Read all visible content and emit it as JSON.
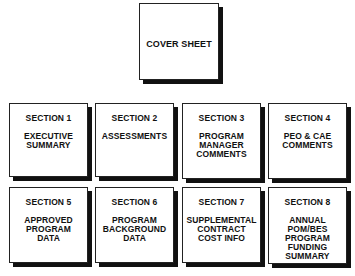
{
  "cover": {
    "title": "COVER SHEET"
  },
  "sections": [
    {
      "header": "SECTION 1",
      "lines": [
        "EXECUTIVE",
        "SUMMARY"
      ]
    },
    {
      "header": "SECTION 2",
      "lines": [
        "ASSESSMENTS"
      ]
    },
    {
      "header": "SECTION 3",
      "lines": [
        "PROGRAM",
        "MANAGER",
        "COMMENTS"
      ]
    },
    {
      "header": "SECTION 4",
      "lines": [
        "PEO & CAE",
        "COMMENTS"
      ]
    },
    {
      "header": "SECTION 5",
      "lines": [
        "APPROVED",
        "PROGRAM",
        "DATA"
      ]
    },
    {
      "header": "SECTION 6",
      "lines": [
        "PROGRAM",
        "BACKGROUND",
        "DATA"
      ]
    },
    {
      "header": "SECTION 7",
      "lines": [
        "SUPPLEMENTAL",
        "CONTRACT",
        "COST INFO"
      ]
    },
    {
      "header": "SECTION 8",
      "lines": [
        "ANNUAL",
        "POM/BES",
        "PROGRAM",
        "FUNDING",
        "SUMMARY"
      ]
    }
  ]
}
